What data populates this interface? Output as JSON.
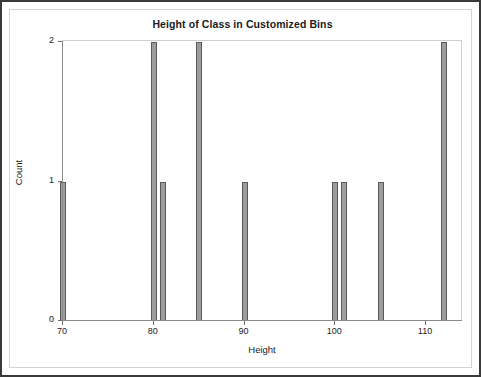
{
  "chart_data": {
    "type": "bar",
    "title": "Height of Class in Customized Bins",
    "xlabel": "Height",
    "ylabel": "Count",
    "xlim": [
      69,
      113
    ],
    "ylim": [
      0,
      2
    ],
    "xticks": [
      70,
      80,
      90,
      100,
      110
    ],
    "xtick_labels": [
      "70",
      "80",
      "90",
      "100",
      "110"
    ],
    "yticks": [
      0,
      1,
      2
    ],
    "ytick_labels": [
      "0",
      "1",
      "2"
    ],
    "grid": false,
    "legend": null,
    "bar_color": "#9d9d9d",
    "bar_edge_color": "#5a5a5a",
    "categories": [
      70,
      80,
      81,
      85,
      90,
      100,
      101,
      105,
      112
    ],
    "values": [
      1,
      2,
      1,
      2,
      1,
      1,
      1,
      1,
      2
    ],
    "bars": [
      {
        "x": 70,
        "count": 1
      },
      {
        "x": 80,
        "count": 2
      },
      {
        "x": 81,
        "count": 1
      },
      {
        "x": 85,
        "count": 2
      },
      {
        "x": 90,
        "count": 1
      },
      {
        "x": 100,
        "count": 1
      },
      {
        "x": 101,
        "count": 1
      },
      {
        "x": 105,
        "count": 1
      },
      {
        "x": 112,
        "count": 2
      }
    ]
  },
  "frame": {
    "border_color": "#3a3a3a",
    "inner_border_color": "#d4d4d4"
  }
}
